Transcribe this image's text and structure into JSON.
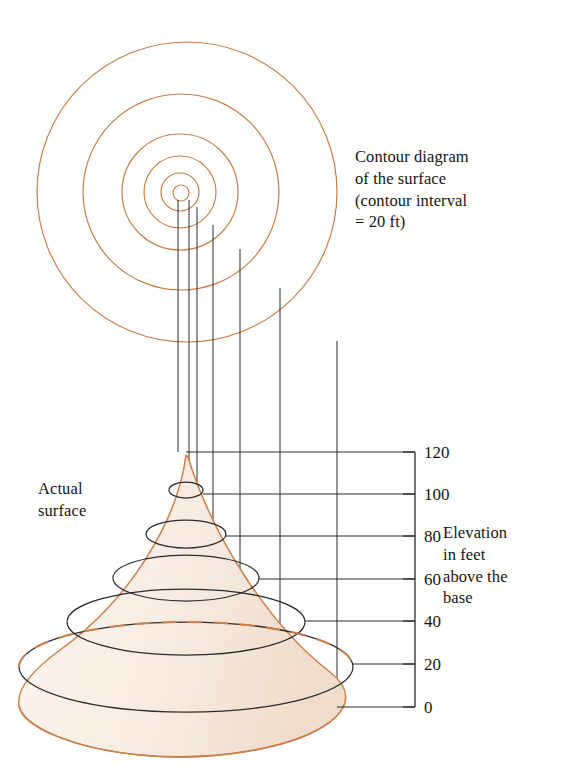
{
  "figure": {
    "colors": {
      "contour_orange": "#C87B45",
      "surface_outline": "#CB7F4A",
      "surface_fill": "#F7ECE2",
      "line_black": "#2B2B2B",
      "text": "#191410",
      "background": "#FFFFFF"
    }
  },
  "captions": {
    "contour_diagram": "Contour diagram\nof the surface\n(contour interval\n= 20 ft)",
    "actual_surface": "Actual\nsurface",
    "elevation": "Elevation\nin feet\nabove the\nbase"
  },
  "axis": {
    "name": "elevation-axis",
    "unit": "ft",
    "interval": 20,
    "ticks": [
      {
        "value": "120",
        "y": 452
      },
      {
        "value": "100",
        "y": 494
      },
      {
        "value": "80",
        "y": 536
      },
      {
        "value": "60",
        "y": 579
      },
      {
        "value": "40",
        "y": 621
      },
      {
        "value": "20",
        "y": 664
      },
      {
        "value": "0",
        "y": 707
      }
    ]
  },
  "chart_data": {
    "type": "contour",
    "title": "Contour diagram of the surface",
    "contour_interval": 20,
    "contour_unit": "ft",
    "levels": [
      0,
      20,
      40,
      60,
      80,
      100,
      120
    ],
    "xlabel": "",
    "ylabel": "Elevation in feet above the base",
    "ylim": [
      0,
      120
    ],
    "legend": "none",
    "grid": false,
    "contour_circles": [
      {
        "level": 20,
        "cx": 187,
        "cy": 192,
        "r": 150
      },
      {
        "level": 40,
        "cx": 181,
        "cy": 192,
        "r": 98
      },
      {
        "level": 60,
        "cx": 180,
        "cy": 192,
        "r": 58
      },
      {
        "level": 80,
        "cx": 180,
        "cy": 192,
        "r": 36
      },
      {
        "level": 100,
        "cx": 180,
        "cy": 192,
        "r": 19
      },
      {
        "level": 120,
        "cx": 181,
        "cy": 193,
        "r": 8
      }
    ],
    "surface_ellipses": [
      {
        "level": 120,
        "cx": 186,
        "cy": 455,
        "rx": 2,
        "ry": 1
      },
      {
        "level": 100,
        "cx": 186,
        "cy": 490,
        "rx": 17,
        "ry": 8
      },
      {
        "level": 80,
        "cx": 186,
        "cy": 534,
        "rx": 40,
        "ry": 14
      },
      {
        "level": 60,
        "cx": 186,
        "cy": 578,
        "rx": 73,
        "ry": 23
      },
      {
        "level": 40,
        "cx": 186,
        "cy": 622,
        "rx": 119,
        "ry": 33
      },
      {
        "level": 20,
        "cx": 186,
        "cy": 667,
        "rx": 167,
        "ry": 45
      }
    ],
    "projection_lines_x": [
      178,
      189,
      197,
      213,
      240,
      280,
      337
    ]
  }
}
